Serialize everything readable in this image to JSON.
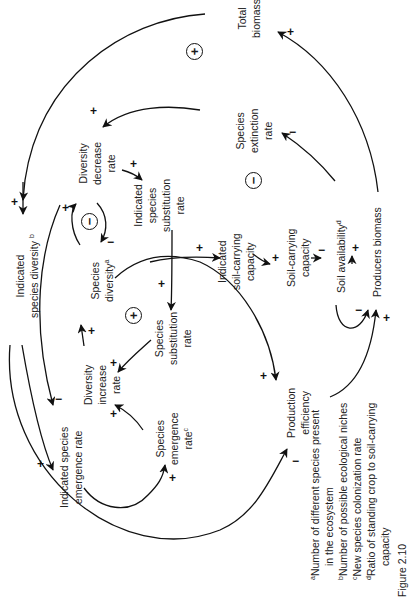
{
  "figure": {
    "caption": "Figure 2.10",
    "orientation": "rotated 90° counter-clockwise"
  },
  "nodes": {
    "total_biomass": [
      "Total",
      "biomass"
    ],
    "species_extinction_rate": [
      "Species",
      "extinction",
      "rate"
    ],
    "diversity_decrease_rate": [
      "Diversity",
      "decrease",
      "rate"
    ],
    "indicated_species_substitution_rate": [
      "Indicated",
      "species",
      "substitution",
      "rate"
    ],
    "indicated_species_diversity": [
      "Indicated",
      "species diversity"
    ],
    "indicated_species_diversity_sup": "b",
    "species_diversity": [
      "Species",
      "diversity"
    ],
    "species_diversity_sup": "a",
    "indicated_soil_carrying_capacity": [
      "Indicated",
      "soil-carrying",
      "capacity"
    ],
    "soil_carrying_capacity": [
      "Soil-carrying",
      "capacity"
    ],
    "soil_availability": "Soil availability",
    "soil_availability_sup": "d",
    "producers_biomass": "Producers biomass",
    "species_substitution_rate": [
      "Species",
      "substitution",
      "rate"
    ],
    "diversity_increase_rate": [
      "Diversity",
      "increase",
      "rate"
    ],
    "indicated_species_emergence_rate": [
      "Indicated species",
      "emergence rate"
    ],
    "species_emergence_rate": [
      "Species",
      "emergence",
      "rate"
    ],
    "species_emergence_rate_sup": "c",
    "production_efficiency": [
      "Production",
      "efficiency"
    ]
  },
  "loops": {
    "outer": "+",
    "extinction": "−",
    "diversity_balance": "−",
    "substitution": "+"
  },
  "signs": {
    "plus": "+",
    "minus": "−"
  },
  "footnotes": [
    {
      "marker": "a",
      "text": "Number of different species present",
      "cont": "in the ecosystem"
    },
    {
      "marker": "b",
      "text": "Number of possible ecological niches"
    },
    {
      "marker": "c",
      "text": "New species colonization rate"
    },
    {
      "marker": "d",
      "text": "Ratio of standing crop to soil-carrying",
      "cont": "capacity"
    }
  ]
}
